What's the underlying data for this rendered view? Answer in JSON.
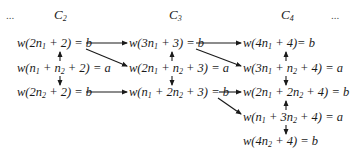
{
  "header": {
    "left_ellipsis": "...",
    "columns": [
      "C",
      "C",
      "C"
    ],
    "column_subscripts": [
      "2",
      "3",
      "4"
    ],
    "right_ellipsis": "..."
  },
  "nodes": {
    "c2_r1": {
      "pre": "w(2n",
      "s1": "1",
      "post": " + 2) = b"
    },
    "c2_r2": {
      "pre": "w(n",
      "s1": "1",
      "mid": " + n",
      "s2": "2",
      "post": " + 2) = a"
    },
    "c2_r3": {
      "pre": "w(2n",
      "s1": "2",
      "post": " + 2) = b"
    },
    "c3_r1": {
      "pre": "w(3n",
      "s1": "1",
      "post": " + 3) = b"
    },
    "c3_r2": {
      "pre": "w(2n",
      "s1": "1",
      "mid": " + n",
      "s2": "2",
      "post": " + 3) = a"
    },
    "c3_r3": {
      "pre": "w(n",
      "s1": "1",
      "mid": " + 2n",
      "s2": "2",
      "post": " + 3) = b"
    },
    "c4_r1": {
      "pre": "w(4n",
      "s1": "1",
      "post": " + 4)= b"
    },
    "c4_r2": {
      "pre": "w(3n",
      "s1": "1",
      "mid": " + n",
      "s2": "2",
      "post": " + 4) = a"
    },
    "c4_r3": {
      "pre": "w(2n",
      "s1": "1",
      "mid": " + 2n",
      "s2": "2",
      "post": " + 4) = b"
    },
    "c4_r4": {
      "pre": "w(n",
      "s1": "1",
      "mid": " + 3n",
      "s2": "2",
      "post": " + 4) = a"
    },
    "c4_r5": {
      "pre": "w(4n",
      "s1": "2",
      "post": " + 4) = b"
    }
  },
  "edges": [
    [
      "c2_r2",
      "c2_r1"
    ],
    [
      "c2_r2",
      "c2_r3"
    ],
    [
      "c2_r1",
      "c3_r1"
    ],
    [
      "c2_r1",
      "c3_r2"
    ],
    [
      "c2_r3",
      "c3_r3"
    ],
    [
      "c3_r2",
      "c3_r1"
    ],
    [
      "c3_r2",
      "c3_r3"
    ],
    [
      "c3_r1",
      "c4_r1"
    ],
    [
      "c3_r1",
      "c4_r2"
    ],
    [
      "c3_r3",
      "c4_r3"
    ],
    [
      "c3_r3",
      "c4_r4"
    ],
    [
      "c4_r2",
      "c4_r1"
    ],
    [
      "c4_r2",
      "c4_r3"
    ],
    [
      "c4_r4",
      "c4_r3"
    ],
    [
      "c4_r4",
      "c4_r5"
    ]
  ]
}
